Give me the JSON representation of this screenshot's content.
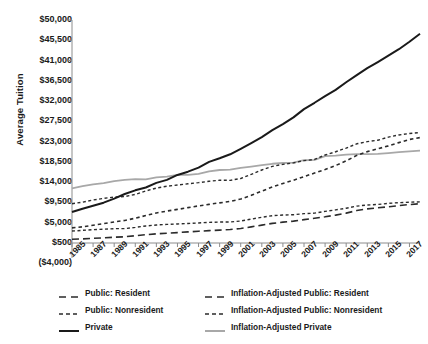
{
  "chart_data": {
    "type": "line",
    "title": "",
    "xlabel": "",
    "ylabel": "Average Tuition",
    "grid": false,
    "legend_position": "bottom",
    "x": [
      1985,
      1986,
      1987,
      1988,
      1989,
      1990,
      1991,
      1992,
      1993,
      1994,
      1995,
      1996,
      1997,
      1998,
      1999,
      2000,
      2001,
      2002,
      2003,
      2004,
      2005,
      2006,
      2007,
      2008,
      2009,
      2010,
      2011,
      2012,
      2013,
      2014,
      2015,
      2016,
      2017,
      2018
    ],
    "xlim": [
      1985,
      2018
    ],
    "ylim": [
      -4000,
      50000
    ],
    "ytick_values": [
      -4000,
      500,
      5000,
      9500,
      14000,
      18500,
      23000,
      27500,
      32000,
      36500,
      41000,
      45500,
      50000
    ],
    "ytick_labels": [
      "($4,000)",
      "$500",
      "$5,000",
      "$9,500",
      "$14,000",
      "$18,500",
      "$23,000",
      "$27,500",
      "$32,000",
      "$36,500",
      "$41,000",
      "$45,500",
      "$50,000"
    ],
    "xtick_values": [
      1985,
      1987,
      1989,
      1991,
      1993,
      1995,
      1997,
      1999,
      2001,
      2003,
      2005,
      2007,
      2009,
      2011,
      2013,
      2015,
      2017
    ],
    "xtick_labels": [
      "1985",
      "1987",
      "1989",
      "1991",
      "1993",
      "1995",
      "1997",
      "1999",
      "2001",
      "2003",
      "2005",
      "2007",
      "2009",
      "2011",
      "2013",
      "2015",
      "2017"
    ],
    "series": [
      {
        "name": "Public: Resident",
        "color": "#2b2b2b",
        "width": 1.6,
        "dash": "7,4",
        "values": [
          1318,
          1414,
          1537,
          1646,
          1781,
          1888,
          2107,
          2349,
          2537,
          2681,
          2811,
          2966,
          3110,
          3247,
          3362,
          3487,
          3725,
          4081,
          4476,
          4848,
          5126,
          5351,
          5685,
          6003,
          6312,
          6695,
          7136,
          7703,
          8070,
          8312,
          8543,
          8804,
          9037,
          9212
        ]
      },
      {
        "name": "Public: Nonresident",
        "color": "#2b2b2b",
        "width": 1.6,
        "dash": "3.5,3",
        "values": [
          3859,
          4089,
          4452,
          4792,
          5175,
          5510,
          6001,
          6600,
          7166,
          7590,
          7960,
          8353,
          8735,
          9074,
          9413,
          9723,
          10263,
          11082,
          12015,
          12947,
          13725,
          14419,
          15231,
          16027,
          16806,
          17700,
          18736,
          19948,
          20782,
          21403,
          22063,
          22780,
          23478,
          23900
        ]
      },
      {
        "name": "Private",
        "color": "#1a1a1a",
        "width": 2.0,
        "dash": "",
        "values": [
          7374,
          8118,
          8771,
          9451,
          10348,
          11379,
          12192,
          12820,
          13844,
          14508,
          15605,
          16332,
          17229,
          18516,
          19307,
          20186,
          21406,
          22686,
          24017,
          25541,
          26889,
          28384,
          30222,
          31627,
          33107,
          34483,
          36190,
          37771,
          39306,
          40673,
          42100,
          43513,
          45176,
          46950
        ]
      },
      {
        "name": "Inflation-Adjusted Public: Resident",
        "color": "#2b2b2b",
        "width": 1.4,
        "dash": "3,2.5",
        "values": [
          3149,
          3310,
          3470,
          3570,
          3681,
          3700,
          3962,
          4287,
          4494,
          4629,
          4721,
          4843,
          4946,
          5083,
          5154,
          5168,
          5378,
          5799,
          6223,
          6559,
          6707,
          6784,
          7011,
          7133,
          7524,
          7850,
          8216,
          8689,
          8935,
          9055,
          9297,
          9462,
          9553,
          9640
        ]
      },
      {
        "name": "Inflation-Adjusted Public: Nonresident",
        "color": "#2b2b2b",
        "width": 1.4,
        "dash": "3,2.5",
        "values": [
          9218,
          9572,
          10050,
          10393,
          10697,
          10797,
          11284,
          12043,
          12694,
          13105,
          13369,
          13636,
          13893,
          14205,
          14430,
          14407,
          14818,
          15748,
          16707,
          17517,
          17954,
          18281,
          18784,
          19041,
          20034,
          20752,
          21572,
          22521,
          22999,
          23314,
          24007,
          24485,
          24813,
          25000
        ]
      },
      {
        "name": "Inflation-Adjusted Private",
        "color": "#a8a8a8",
        "width": 1.8,
        "dash": "",
        "values": [
          12611,
          13120,
          13531,
          13774,
          14253,
          14520,
          14662,
          14645,
          15084,
          15234,
          15603,
          15628,
          15843,
          16395,
          16705,
          16797,
          17161,
          17451,
          17771,
          18088,
          18255,
          18340,
          18873,
          18944,
          19776,
          19881,
          20135,
          20219,
          20244,
          20279,
          20457,
          20664,
          20817,
          21000
        ]
      }
    ]
  },
  "legend": {
    "entries": [
      {
        "label": "Public: Resident",
        "swatch": "dash-long",
        "color": "#2b2b2b",
        "column": 1,
        "row": 1
      },
      {
        "label": "Inflation-Adjusted Public: Resident",
        "swatch": "dash-long",
        "color": "#2b2b2b",
        "column": 2,
        "row": 1
      },
      {
        "label": "Public: Nonresident",
        "swatch": "dash-short",
        "color": "#2b2b2b",
        "column": 1,
        "row": 2
      },
      {
        "label": "Inflation-Adjusted Public: Nonresident",
        "swatch": "dash-short",
        "color": "#2b2b2b",
        "column": 2,
        "row": 2
      },
      {
        "label": "Private",
        "swatch": "solid",
        "color": "#1a1a1a",
        "column": 1,
        "row": 3
      },
      {
        "label": "Inflation-Adjusted Private",
        "swatch": "solid",
        "color": "#a8a8a8",
        "column": 2,
        "row": 3
      }
    ]
  },
  "axis_style": {
    "axis_color": "#8c8c8c",
    "text_color": "#1a1a1a"
  }
}
